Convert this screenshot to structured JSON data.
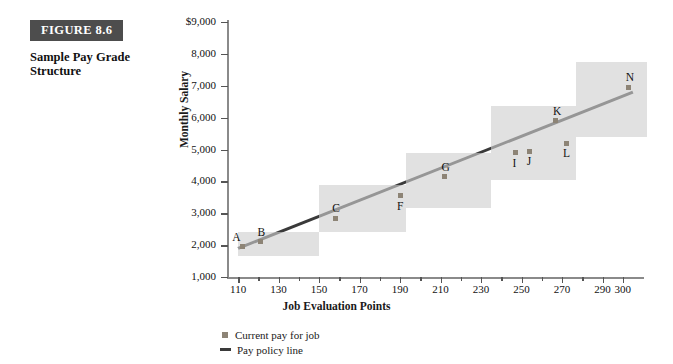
{
  "figure": {
    "tag": "FIGURE 8.6",
    "caption": "Sample Pay Grade Structure"
  },
  "legend": {
    "items": [
      {
        "label": "Current pay for job",
        "marker": "square",
        "color": "#8d8476"
      },
      {
        "label": "Pay policy line",
        "marker": "line",
        "color": "#3a3a3a"
      }
    ]
  },
  "chart_data": {
    "type": "scatter",
    "title": "Sample Pay Grade Structure",
    "xlabel": "Job Evaluation Points",
    "ylabel": "Monthly Salary",
    "xlim": [
      105,
      310
    ],
    "ylim": [
      1000,
      9000
    ],
    "grid": false,
    "legend_position": "bottom",
    "ytick_labels": [
      "$9,000",
      "8,000",
      "7,000",
      "6,000",
      "5,000",
      "4,000",
      "3,000",
      "2,000",
      "1,000"
    ],
    "ytick_values": [
      9000,
      8000,
      7000,
      6000,
      5000,
      4000,
      3000,
      2000,
      1000
    ],
    "xtick_labels": [
      "110",
      "130",
      "150",
      "170",
      "190",
      "210",
      "230",
      "250",
      "270",
      "290",
      "300"
    ],
    "xtick_values": [
      110,
      130,
      150,
      170,
      190,
      210,
      230,
      250,
      270,
      290,
      300
    ],
    "xtick_minor": [
      120,
      140,
      160,
      180,
      200,
      220,
      240,
      260,
      280
    ],
    "points": [
      {
        "label": "A",
        "x": 112,
        "y": 1950
      },
      {
        "label": "B",
        "x": 121,
        "y": 2100
      },
      {
        "label": "C",
        "x": 158,
        "y": 2850
      },
      {
        "label": "F",
        "x": 190,
        "y": 3550
      },
      {
        "label": "G",
        "x": 212,
        "y": 4150
      },
      {
        "label": "I",
        "x": 247,
        "y": 4900
      },
      {
        "label": "J",
        "x": 254,
        "y": 4950
      },
      {
        "label": "K",
        "x": 267,
        "y": 5900
      },
      {
        "label": "L",
        "x": 272,
        "y": 5200
      },
      {
        "label": "N",
        "x": 303,
        "y": 6950
      }
    ],
    "policy_line": {
      "name": "Pay policy line",
      "x": [
        110,
        305
      ],
      "y": [
        1900,
        6800
      ],
      "color": "#3a3a3a"
    },
    "grade_bands": [
      {
        "grade": 1,
        "x_min": 110,
        "x_max": 150,
        "pay_min": 1650,
        "pay_max": 2400
      },
      {
        "grade": 2,
        "x_min": 150,
        "x_max": 193,
        "pay_min": 2400,
        "pay_max": 3900
      },
      {
        "grade": 3,
        "x_min": 193,
        "x_max": 235,
        "pay_min": 3150,
        "pay_max": 4900
      },
      {
        "grade": 4,
        "x_min": 235,
        "x_max": 277,
        "pay_min": 4050,
        "pay_max": 6350
      },
      {
        "grade": 5,
        "x_min": 277,
        "x_max": 312,
        "pay_min": 5400,
        "pay_max": 7750
      }
    ],
    "band_color": "#cfcfcf"
  }
}
